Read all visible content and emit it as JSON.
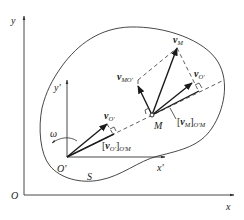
{
  "diagram": {
    "type": "kinematics-velocity-projection",
    "labels": {
      "outer_y_axis": "y",
      "outer_x_axis": "x",
      "outer_origin": "O",
      "inner_y_axis": "y'",
      "inner_x_axis": "x'",
      "inner_origin": "O'",
      "point_m": "M",
      "body": "S",
      "angular_velocity": "ω",
      "v_m": {
        "main": "v",
        "sub": "M"
      },
      "v_mo": {
        "main": "v",
        "sub": "MO'"
      },
      "v_o_at_m": {
        "main": "v",
        "sub": "O'"
      },
      "v_o_at_o": {
        "main": "v",
        "sub": "O'"
      },
      "proj_vm": {
        "main": "[v",
        "mid": "M",
        "close": "]",
        "sub": "O'M"
      },
      "proj_vo": {
        "main": "[v",
        "mid": "O'",
        "close": "]",
        "sub": "O'M"
      }
    },
    "colors": {
      "stroke": "#1a1a1a",
      "background": "#ffffff"
    }
  }
}
